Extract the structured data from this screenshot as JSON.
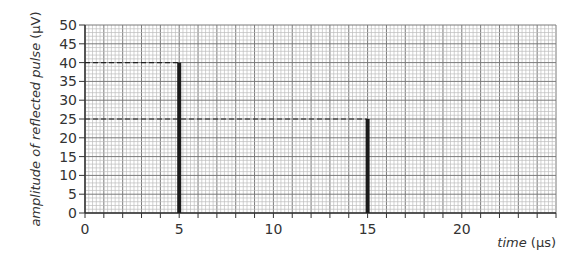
{
  "chart_data": {
    "type": "bar",
    "title": "",
    "xlabel": "time (μs)",
    "xlabel_italic_part": "time",
    "xlabel_unit": "(μs)",
    "ylabel": "amplitude of reflected pulse (μV)",
    "ylabel_italic_part": "amplitude of reflected pulse",
    "ylabel_unit": "(μV)",
    "xlim": [
      0,
      25
    ],
    "ylim": [
      0,
      50
    ],
    "x_ticks": [
      0,
      5,
      10,
      15,
      20
    ],
    "x_minor_tick_every": 1,
    "y_ticks": [
      0,
      5,
      10,
      15,
      20,
      25,
      30,
      35,
      40,
      45,
      50
    ],
    "grid": true,
    "grid_minor_divisions": 5,
    "legend": null,
    "series": [
      {
        "name": "reflected pulse",
        "x": [
          5,
          15
        ],
        "values": [
          40,
          25
        ]
      }
    ],
    "annotations": [
      {
        "type": "dashed-hline",
        "y": 40,
        "x_from": 0,
        "x_to": 5
      },
      {
        "type": "dashed-hline",
        "y": 25,
        "x_from": 0,
        "x_to": 15
      }
    ],
    "colors": {
      "bar": "#1a1a1a",
      "grid_major": "#7a7a7a",
      "grid_minor": "#bdbdbd",
      "axis": "#333333"
    }
  }
}
